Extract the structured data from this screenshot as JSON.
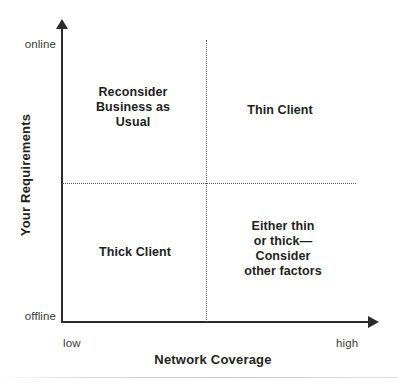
{
  "chart_data": {
    "type": "scatter",
    "title": "",
    "subtitle": "",
    "xlabel": "Network Coverage",
    "ylabel": "Your Requirements",
    "x_tick_labels": [
      "low",
      "high"
    ],
    "y_tick_labels": [
      "offline",
      "online"
    ],
    "grid": false,
    "legend": "none",
    "axis_style": "arrow-headed open axes",
    "divider_style": "dotted",
    "quadrants": [
      {
        "id": "top-left",
        "x_band": "low",
        "y_band": "online",
        "label": "Reconsider\nBusiness as\nUsual",
        "lines": [
          "Reconsider",
          "Business as",
          "Usual"
        ]
      },
      {
        "id": "top-right",
        "x_band": "high",
        "y_band": "online",
        "label": "Thin Client",
        "lines": [
          "Thin Client"
        ]
      },
      {
        "id": "bottom-left",
        "x_band": "low",
        "y_band": "offline",
        "label": "Thick Client",
        "lines": [
          "Thick Client"
        ]
      },
      {
        "id": "bottom-right",
        "x_band": "high",
        "y_band": "offline",
        "label": "Either thin\nor thick—\nConsider\nother factors",
        "lines": [
          "Either thin",
          "or thick—",
          "Consider",
          "other factors"
        ]
      }
    ],
    "colors": {
      "background": "#ffffff",
      "axis": "#2b2b2b",
      "text": "#231f20",
      "tick_text": "#3a3a3a",
      "divider": "#555555"
    }
  },
  "axes": {
    "y": {
      "title": "Your Requirements",
      "top_tick": "online",
      "bottom_tick": "offline"
    },
    "x": {
      "title": "Network Coverage",
      "left_tick": "low",
      "right_tick": "high"
    }
  },
  "quadrant_text": {
    "top_left": "Reconsider\nBusiness as\nUsual",
    "top_right": "Thin Client",
    "bottom_left": "Thick Client",
    "bottom_right": "Either thin\nor thick—\nConsider\nother factors"
  }
}
